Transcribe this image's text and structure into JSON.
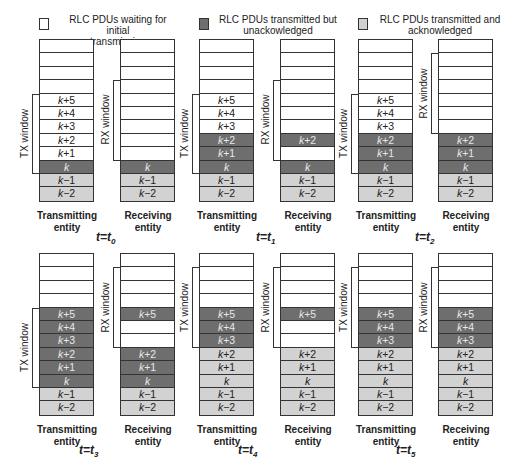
{
  "legend": [
    {
      "label": "RLC PDUs waiting for initial transmission",
      "line1": "RLC PDUs waiting for initial",
      "line2": "transmission",
      "state": "waiting",
      "color": "#ffffff"
    },
    {
      "label": "RLC PDUs transmitted but unackowledged",
      "line1": "RLC PDUs transmitted but",
      "line2": "unackowledged",
      "state": "unack",
      "color": "#6e6e6e"
    },
    {
      "label": "RLC PDUs transmitted and acknowledged",
      "line1": "RLC PDUs transmitted and",
      "line2": "acknowledged",
      "state": "ack",
      "color": "#d2d2d2"
    }
  ],
  "labels": {
    "tx_window": "TX window",
    "rx_window": "RX window",
    "tx_entity_line1": "Transmitting",
    "tx_entity_line2": "entity",
    "rx_entity_line1": "Receiving",
    "rx_entity_line2": "entity"
  },
  "pdu_labels": [
    "",
    "",
    "",
    "",
    "k+5",
    "k+4",
    "k+3",
    "k+2",
    "k+1",
    "k",
    "k−1",
    "k−2"
  ],
  "panels": [
    {
      "time": "t=t0",
      "time_var": "t=t",
      "time_sub": "0",
      "tx": {
        "cells": [
          "waiting",
          "waiting",
          "waiting",
          "waiting",
          "waiting",
          "waiting",
          "waiting",
          "waiting",
          "waiting",
          "unack",
          "ack",
          "ack"
        ],
        "labels": [
          "",
          "",
          "",
          "",
          "k+5",
          "k+4",
          "k+3",
          "k+2",
          "k+1",
          "k",
          "k−1",
          "k−2"
        ],
        "window": [
          4,
          9
        ]
      },
      "rx": {
        "cells": [
          "waiting",
          "waiting",
          "waiting",
          "waiting",
          "waiting",
          "waiting",
          "waiting",
          "waiting",
          "waiting",
          "unack",
          "ack",
          "ack"
        ],
        "labels": [
          "",
          "",
          "",
          "",
          "",
          "",
          "",
          "",
          "",
          "k",
          "k−1",
          "k−2"
        ],
        "window": [
          3,
          8
        ]
      }
    },
    {
      "time": "t=t1",
      "time_var": "t=t",
      "time_sub": "1",
      "tx": {
        "cells": [
          "waiting",
          "waiting",
          "waiting",
          "waiting",
          "waiting",
          "waiting",
          "waiting",
          "unack",
          "unack",
          "unack",
          "ack",
          "ack"
        ],
        "labels": [
          "",
          "",
          "",
          "",
          "k+5",
          "k+4",
          "k+3",
          "k+2",
          "k+1",
          "k",
          "k−1",
          "k−2"
        ],
        "window": [
          4,
          9
        ]
      },
      "rx": {
        "cells": [
          "waiting",
          "waiting",
          "waiting",
          "waiting",
          "waiting",
          "waiting",
          "waiting",
          "unack",
          "waiting",
          "unack",
          "ack",
          "ack"
        ],
        "labels": [
          "",
          "",
          "",
          "",
          "",
          "",
          "",
          "k+2",
          "",
          "k",
          "k−1",
          "k−2"
        ],
        "window": [
          3,
          8
        ]
      }
    },
    {
      "time": "t=t2",
      "time_var": "t=t",
      "time_sub": "2",
      "tx": {
        "cells": [
          "waiting",
          "waiting",
          "waiting",
          "waiting",
          "waiting",
          "waiting",
          "waiting",
          "unack",
          "unack",
          "unack",
          "ack",
          "ack"
        ],
        "labels": [
          "",
          "",
          "",
          "",
          "k+5",
          "k+4",
          "k+3",
          "k+2",
          "k+1",
          "k",
          "k−1",
          "k−2"
        ],
        "window": [
          4,
          9
        ]
      },
      "rx": {
        "cells": [
          "waiting",
          "waiting",
          "waiting",
          "waiting",
          "waiting",
          "waiting",
          "waiting",
          "unack",
          "unack",
          "unack",
          "ack",
          "ack"
        ],
        "labels": [
          "",
          "",
          "",
          "",
          "",
          "",
          "",
          "k+2",
          "k+1",
          "k",
          "k−1",
          "k−2"
        ],
        "window": [
          1,
          6
        ]
      }
    },
    {
      "time": "t=t3",
      "time_var": "t=t",
      "time_sub": "3",
      "tx": {
        "cells": [
          "waiting",
          "waiting",
          "waiting",
          "waiting",
          "unack",
          "unack",
          "unack",
          "unack",
          "unack",
          "unack",
          "ack",
          "ack"
        ],
        "labels": [
          "",
          "",
          "",
          "",
          "k+5",
          "k+4",
          "k+3",
          "k+2",
          "k+1",
          "k",
          "k−1",
          "k−2"
        ],
        "window": [
          4,
          9
        ]
      },
      "rx": {
        "cells": [
          "waiting",
          "waiting",
          "waiting",
          "waiting",
          "unack",
          "waiting",
          "waiting",
          "unack",
          "unack",
          "unack",
          "ack",
          "ack"
        ],
        "labels": [
          "",
          "",
          "",
          "",
          "k+5",
          "",
          "",
          "k+2",
          "k+1",
          "k",
          "k−1",
          "k−2"
        ],
        "window": [
          1,
          6
        ]
      }
    },
    {
      "time": "t=t4",
      "time_var": "t=t",
      "time_sub": "4",
      "tx": {
        "cells": [
          "waiting",
          "waiting",
          "waiting",
          "waiting",
          "unack",
          "unack",
          "unack",
          "ack",
          "ack",
          "ack",
          "ack",
          "ack"
        ],
        "labels": [
          "",
          "",
          "",
          "",
          "k+5",
          "k+4",
          "k+3",
          "k+2",
          "k+1",
          "k",
          "k−1",
          "k−2"
        ],
        "window": [
          1,
          6
        ]
      },
      "rx": {
        "cells": [
          "waiting",
          "waiting",
          "waiting",
          "waiting",
          "unack",
          "waiting",
          "waiting",
          "ack",
          "ack",
          "ack",
          "ack",
          "ack"
        ],
        "labels": [
          "",
          "",
          "",
          "",
          "k+5",
          "",
          "",
          "k+2",
          "k+1",
          "k",
          "k−1",
          "k−2"
        ],
        "window": [
          1,
          6
        ]
      }
    },
    {
      "time": "t=t5",
      "time_var": "t=t",
      "time_sub": "5",
      "tx": {
        "cells": [
          "waiting",
          "waiting",
          "waiting",
          "waiting",
          "unack",
          "unack",
          "unack",
          "ack",
          "ack",
          "ack",
          "ack",
          "ack"
        ],
        "labels": [
          "",
          "",
          "",
          "",
          "k+5",
          "k+4",
          "k+3",
          "k+2",
          "k+1",
          "k",
          "k−1",
          "k−2"
        ],
        "window": [
          1,
          6
        ]
      },
      "rx": {
        "cells": [
          "waiting",
          "waiting",
          "waiting",
          "waiting",
          "unack",
          "unack",
          "unack",
          "ack",
          "ack",
          "ack",
          "ack",
          "ack"
        ],
        "labels": [
          "",
          "",
          "",
          "",
          "k+5",
          "k+4",
          "k+3",
          "k+2",
          "k+1",
          "k",
          "k−1",
          "k−2"
        ],
        "window": [
          1,
          6
        ]
      }
    }
  ]
}
